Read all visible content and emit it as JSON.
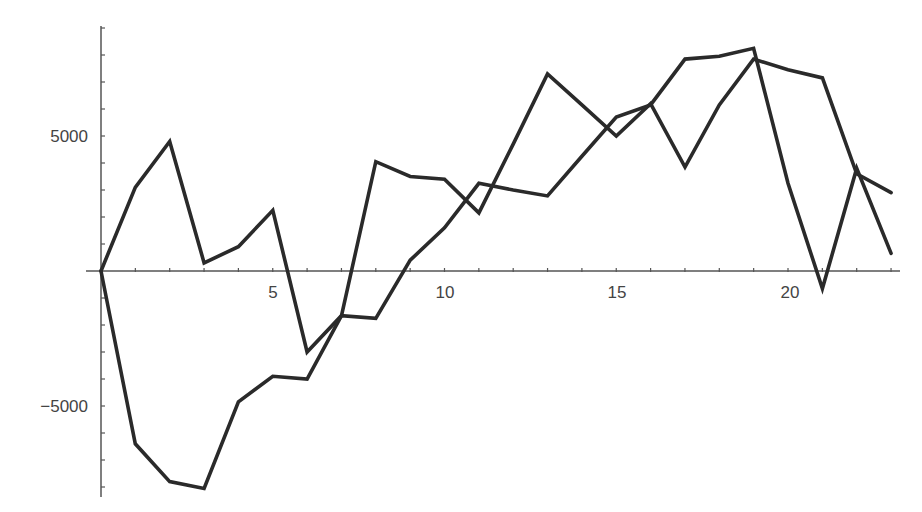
{
  "chart_data": {
    "type": "line",
    "title": "",
    "xlabel": "",
    "ylabel": "",
    "xlim": [
      0,
      23
    ],
    "ylim": [
      -8400,
      9000
    ],
    "grid": false,
    "legend": null,
    "x_ticks": [
      5,
      10,
      15,
      20
    ],
    "x_tick_labels": [
      "5",
      "10",
      "15",
      "20"
    ],
    "y_ticks": [
      -5000,
      5000
    ],
    "y_tick_labels": [
      "-5000",
      "5000"
    ],
    "x": [
      0,
      1,
      2,
      3,
      4,
      5,
      6,
      7,
      8,
      9,
      10,
      11,
      12,
      13,
      14,
      15,
      16,
      17,
      18,
      19,
      20,
      21,
      22,
      23
    ],
    "series": [
      {
        "name": "series-1",
        "color": "#2a2a2a",
        "values": [
          0,
          3100,
          4800,
          300,
          900,
          2250,
          -3000,
          -1650,
          4050,
          3500,
          3400,
          2150,
          4700,
          7300,
          6150,
          5000,
          6200,
          3850,
          6150,
          7850,
          7450,
          7150,
          3600,
          2900
        ]
      },
      {
        "name": "series-2",
        "color": "#2a2a2a",
        "values": [
          0,
          -6400,
          -7800,
          -8050,
          -4850,
          -3900,
          -4000,
          -1650,
          -1750,
          400,
          1600,
          3250,
          3000,
          2780,
          4250,
          5700,
          6150,
          7850,
          7950,
          8250,
          3250,
          -650,
          3800,
          650
        ]
      }
    ]
  },
  "axes": {
    "x_labels": [
      "5",
      "10",
      "15",
      "20"
    ],
    "y_labels": [
      "5000",
      "−5000"
    ]
  }
}
